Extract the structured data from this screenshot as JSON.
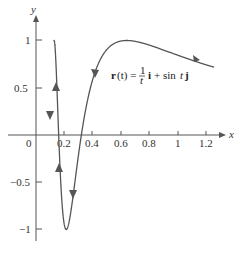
{
  "chart_data": {
    "type": "line",
    "title": "",
    "xlabel": "x",
    "ylabel": "y",
    "xlim": [
      -0.2,
      1.38
    ],
    "ylim": [
      -1.2,
      1.15
    ],
    "grid": false,
    "x_ticks": [
      "0",
      "0.2",
      "0.4",
      "0.6",
      "0.8",
      "1",
      "1.2"
    ],
    "y_ticks": [
      "1",
      "0.5",
      "−0.5",
      "−1"
    ],
    "annotation": "r(t) = (1/t) i + sin t j",
    "series": [
      {
        "name": "r(t) = (1/t) i + sin t j",
        "parametric": "x = 1/t, y = sin t",
        "t_range": [
          0.8,
          8
        ],
        "direction": "from right to left (increasing t)"
      }
    ]
  },
  "labels": {
    "x_axis": "x",
    "y_axis": "y",
    "origin": "0",
    "eq_r": "r",
    "eq_t": "(t) =",
    "eq_num": "1",
    "eq_den": "t",
    "eq_i": "i",
    "eq_plus": "+ sin",
    "eq_t2": "t",
    "eq_j": "j"
  }
}
